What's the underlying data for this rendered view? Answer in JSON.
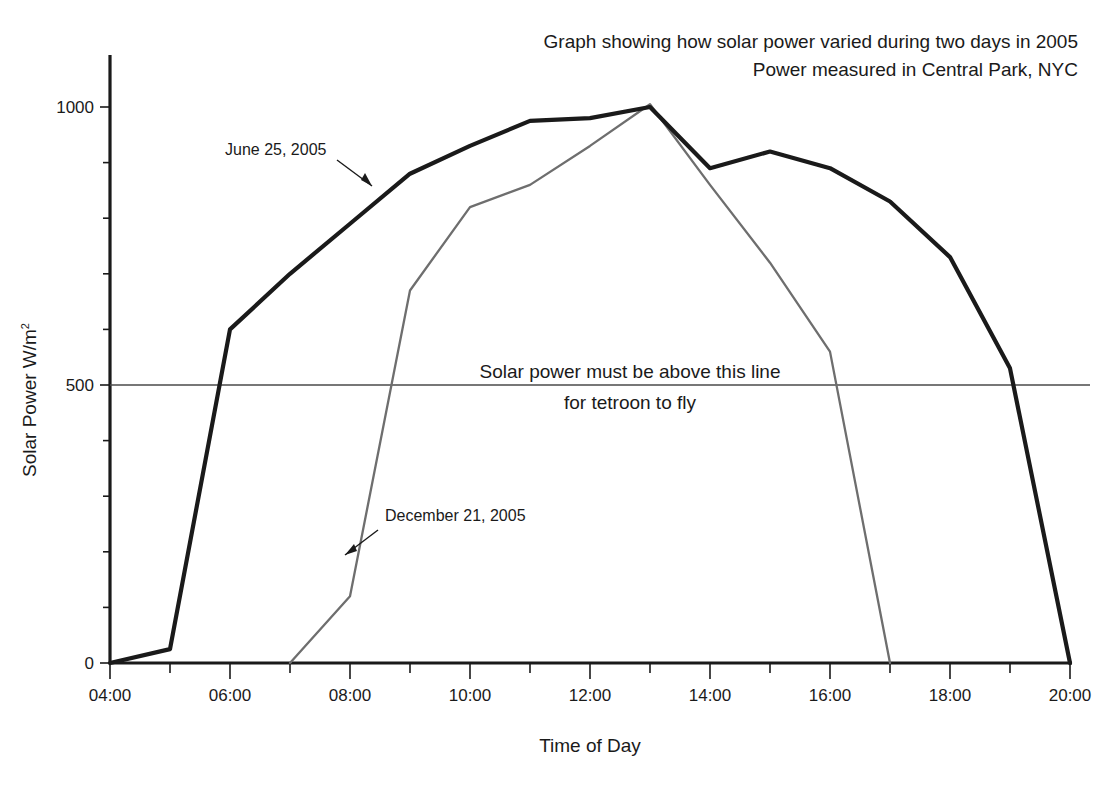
{
  "title": {
    "line1": "Graph showing how solar power varied during two days in 2005",
    "line2": "Power measured in Central Park, NYC"
  },
  "axes": {
    "xlabel": "Time of Day",
    "ylabel_main": "Solar Power W/m",
    "ylabel_exponent": "2"
  },
  "annotations": {
    "june_label": "June 25, 2005",
    "december_label": "December 21, 2005",
    "threshold_line1": "Solar power must be above this line",
    "threshold_line2": "for tetroon to fly"
  },
  "colors": {
    "june_series": "#1a1a1a",
    "december_series": "#6e6e6e",
    "threshold": "#4a4a4a",
    "axis": "#1a1a1a",
    "background": "#ffffff"
  },
  "chart_data": {
    "type": "line",
    "xlabel": "Time of Day",
    "ylabel": "Solar Power W/m2",
    "xlim": [
      4,
      20
    ],
    "ylim": [
      0,
      1080
    ],
    "xticks": [
      4,
      5,
      6,
      7,
      8,
      9,
      10,
      11,
      12,
      13,
      14,
      15,
      16,
      17,
      18,
      19,
      20
    ],
    "xtick_labels": [
      "04:00",
      "",
      "06:00",
      "",
      "08:00",
      "",
      "10:00",
      "",
      "12:00",
      "",
      "14:00",
      "",
      "16:00",
      "",
      "18:00",
      "",
      "20:00"
    ],
    "xtick_labels_major": [
      "04:00",
      "06:00",
      "08:00",
      "10:00",
      "12:00",
      "14:00",
      "16:00",
      "18:00",
      "20:00"
    ],
    "yticks": [
      0,
      100,
      200,
      300,
      400,
      500,
      600,
      700,
      800,
      900,
      1000
    ],
    "ytick_labels_major": [
      "0",
      "500",
      "1000"
    ],
    "grid": false,
    "legend_position": "inline-annotations",
    "x": [
      4,
      5,
      6,
      7,
      8,
      9,
      10,
      11,
      12,
      13,
      14,
      15,
      16,
      17,
      18,
      19,
      20
    ],
    "series": [
      {
        "name": "June 25, 2005",
        "color": "#1a1a1a",
        "x": [
          4,
          5,
          6,
          7,
          8,
          9,
          10,
          11,
          12,
          13,
          14,
          15,
          16,
          17,
          18,
          19,
          20
        ],
        "values": [
          0,
          25,
          600,
          700,
          790,
          880,
          930,
          975,
          980,
          1000,
          890,
          920,
          890,
          830,
          730,
          530,
          0
        ]
      },
      {
        "name": "December 21, 2005",
        "color": "#6e6e6e",
        "x": [
          7,
          8,
          9,
          10,
          11,
          12,
          13,
          14,
          15,
          16,
          17
        ],
        "values": [
          0,
          120,
          670,
          820,
          860,
          930,
          1005,
          860,
          720,
          560,
          0
        ]
      }
    ],
    "reference_lines": [
      {
        "name": "tetroon-threshold",
        "orientation": "horizontal",
        "value": 500,
        "label": "Solar power must be above this line for tetroon to fly"
      }
    ]
  },
  "geometry": {
    "plot_left": 110,
    "plot_right": 1070,
    "plot_bottom": 663,
    "y_zero_px": 663,
    "y_1000_px": 107,
    "y_axis_top": 55
  }
}
